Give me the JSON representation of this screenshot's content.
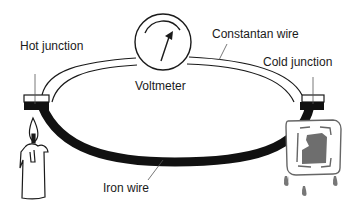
{
  "diagram": {
    "labels": {
      "hot_junction": "Hot junction",
      "voltmeter": "Voltmeter",
      "constantan_wire": "Constantan wire",
      "cold_junction": "Cold junction",
      "iron_wire": "Iron wire"
    },
    "components": [
      {
        "id": "hot_junction",
        "type": "junction",
        "heat_source": "candle"
      },
      {
        "id": "cold_junction",
        "type": "junction",
        "cold_source": "ice-cube"
      },
      {
        "id": "voltmeter",
        "type": "meter"
      },
      {
        "id": "constantan_wire",
        "type": "wire",
        "style": "outlined-white",
        "connects": [
          "hot_junction",
          "voltmeter",
          "cold_junction"
        ]
      },
      {
        "id": "iron_wire",
        "type": "wire",
        "style": "solid-black",
        "connects": [
          "hot_junction",
          "cold_junction"
        ]
      }
    ],
    "colors": {
      "line": "#1a1a1a",
      "iron": "#111111",
      "ice": "#6e6e6e",
      "background": "#ffffff"
    }
  }
}
